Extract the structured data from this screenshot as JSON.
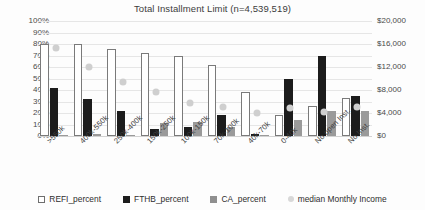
{
  "chart_data": {
    "type": "bar",
    "title": "Total Installment Limit (n=4,539,519)",
    "xlabel": "",
    "ylabel": "",
    "grid": true,
    "legend_position": "bottom",
    "categories": [
      ">550k",
      "400k-550k",
      "250k-400k",
      "150k-250k",
      "100k-150k",
      "70k-100k",
      "40k-70k",
      "0-40k",
      "No open Inst.",
      "No Inst."
    ],
    "ylim": [
      0,
      100
    ],
    "y_ticks": [
      "0%",
      "10%",
      "20%",
      "30%",
      "40%",
      "50%",
      "60%",
      "70%",
      "80%",
      "90%",
      "100%"
    ],
    "y_tick_values": [
      0,
      10,
      20,
      30,
      40,
      50,
      60,
      70,
      80,
      90,
      100
    ],
    "y2lim": [
      0,
      20000
    ],
    "y2_ticks": [
      "$0",
      "$4,000",
      "$8,000",
      "$12,000",
      "$16,000",
      "$20,000"
    ],
    "y2_tick_values": [
      0,
      4000,
      8000,
      12000,
      16000,
      20000
    ],
    "series": [
      {
        "name": "REFI_percent",
        "type": "bar",
        "color": "#ffffff",
        "edge_color": "#7a7a7a",
        "axis": "left",
        "values": [
          80,
          80,
          76,
          72,
          70,
          62,
          38,
          18,
          26,
          33
        ]
      },
      {
        "name": "FTHB_percent",
        "type": "bar",
        "color": "#1c1c1c",
        "axis": "left",
        "values": [
          42,
          32,
          22,
          6,
          8,
          18,
          2,
          50,
          70,
          35
        ]
      },
      {
        "name": "CA_percent",
        "type": "bar",
        "color": "#9a9a9a",
        "axis": "left",
        "values": [
          1,
          2,
          1,
          11,
          12,
          8,
          1,
          14,
          22,
          22
        ]
      },
      {
        "name": "median Monthly Income",
        "type": "scatter",
        "color": "#cfcfcf",
        "axis": "right",
        "values": [
          16000,
          12600,
          10000,
          8200,
          6400,
          5600,
          4600,
          5400,
          4800,
          5600
        ]
      }
    ]
  },
  "legend": {
    "items": [
      {
        "label": "REFI_percent",
        "swatch": "refi"
      },
      {
        "label": "FTHB_percent",
        "swatch": "fthb"
      },
      {
        "label": "CA_percent",
        "swatch": "ca"
      },
      {
        "label": "median Monthly Income",
        "swatch": "income"
      }
    ]
  }
}
